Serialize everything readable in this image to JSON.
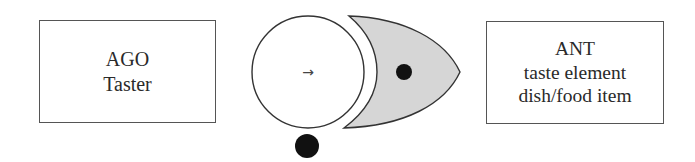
{
  "left_box": {
    "title": "AGO",
    "subtitle": "Taster"
  },
  "right_box": {
    "title": "ANT",
    "line2": "taste element",
    "line3": "dish/food item"
  },
  "center": {
    "circle_symbol": "→",
    "shape_fill": "#d6d6d6",
    "dot_color": "#111111",
    "stroke_color": "#333333"
  }
}
